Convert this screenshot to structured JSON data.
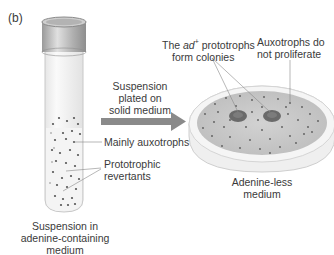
{
  "panel_label": "(b)",
  "tube": {
    "caption_line1": "Suspension in",
    "caption_line2": "adenine-containing",
    "caption_line3": "medium",
    "label_auxotrophs": "Mainly auxotrophs",
    "label_revertants_line1": "Prototrophic",
    "label_revertants_line2": "revertants"
  },
  "arrow": {
    "line1": "Suspension",
    "line2": "plated on",
    "line3": "solid medium"
  },
  "plate": {
    "label_colonies_prefix": "The ",
    "label_colonies_italic": "ad",
    "label_colonies_sup": "+",
    "label_colonies_rest": " prototrophs",
    "label_colonies_line2": "form colonies",
    "label_auxo_line1": "Auxotrophs do",
    "label_auxo_line2": "not proliferate",
    "caption_line1": "Adenine-less",
    "caption_line2": "medium"
  },
  "colors": {
    "arrow": "#8a8a8a",
    "cap": "#a9a9a9",
    "plate_medium": "#c9c9c9",
    "colony": "#6a6a6a",
    "dot": "#555555"
  }
}
